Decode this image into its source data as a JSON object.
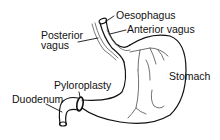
{
  "diagram": {
    "type": "anatomical-illustration",
    "labels": {
      "oesophagus": "Oesophagus",
      "posterior_vagus_line1": "Posterior",
      "posterior_vagus_line2": "vagus",
      "anterior_vagus": "Anterior vagus",
      "stomach": "Stomach",
      "pyloroplasty": "Pyloroplasty",
      "duodenum": "Duodenum"
    },
    "colors": {
      "line": "#111111",
      "background": "#ffffff"
    }
  }
}
